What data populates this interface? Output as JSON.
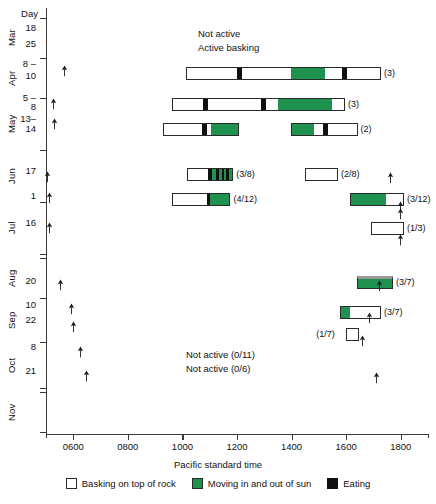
{
  "chart_data": {
    "type": "bar",
    "title": "",
    "xlabel": "Pacific standard time",
    "ylabel": "Day",
    "xlim": [
      500,
      1900
    ],
    "xticks": [
      600,
      800,
      1000,
      1200,
      1400,
      1600,
      1800
    ],
    "xtick_labels": [
      "0600",
      "0800",
      "1000",
      "1200",
      "1400",
      "1600",
      "1800"
    ],
    "grid": false,
    "legend_position": "bottom",
    "legend": [
      {
        "key": "white",
        "label": "Basking on top of rock",
        "color": "#ffffff"
      },
      {
        "key": "green",
        "label": "Moving in and out of sun",
        "color": "#1f9250"
      },
      {
        "key": "black",
        "label": "Eating",
        "color": "#101010"
      }
    ],
    "annotations": [
      {
        "text": "Not active",
        "x": 1050,
        "y_row": "apr-10",
        "offset": -32
      },
      {
        "text": "Active basking",
        "x": 1050,
        "y_row": "apr-10",
        "offset": -20
      },
      {
        "text": "Not active (0/11)",
        "x": 900,
        "y_row": "oct-8"
      },
      {
        "text": "Not active (0/6)",
        "x": 900,
        "y_row": "oct-21"
      }
    ],
    "months": [
      {
        "label": "Mar",
        "top": 18,
        "height": 40
      },
      {
        "label": "Apr",
        "top": 58,
        "height": 40
      },
      {
        "label": "May",
        "top": 98,
        "height": 52
      },
      {
        "label": "Jun",
        "top": 150,
        "height": 52
      },
      {
        "label": "Jul",
        "top": 202,
        "height": 52
      },
      {
        "label": "Aug",
        "top": 258,
        "height": 40
      },
      {
        "label": "Sep",
        "top": 298,
        "height": 44
      },
      {
        "label": "Oct",
        "top": 342,
        "height": 46
      },
      {
        "label": "Nov",
        "top": 392,
        "height": 40
      }
    ],
    "day_labels": [
      {
        "text": "18",
        "y": 28
      },
      {
        "text": "25",
        "y": 44
      },
      {
        "text": "8 –",
        "y": 64
      },
      {
        "text": "10",
        "y": 76
      },
      {
        "text": "5 –",
        "y": 98
      },
      {
        "text": "8",
        "y": 107
      },
      {
        "text": "13–",
        "y": 119
      },
      {
        "text": "14",
        "y": 129
      },
      {
        "text": "17",
        "y": 171
      },
      {
        "text": "1",
        "y": 196
      },
      {
        "text": "16",
        "y": 223
      },
      {
        "text": "20",
        "y": 281
      },
      {
        "text": "10",
        "y": 305
      },
      {
        "text": "22",
        "y": 320
      },
      {
        "text": "8",
        "y": 347
      },
      {
        "text": "21",
        "y": 371
      }
    ],
    "rows": [
      {
        "id": "apr-10",
        "count": "(3)",
        "y": 67,
        "start": 1012,
        "end": 1728,
        "segments": [
          {
            "kind": "white",
            "from": 1012,
            "to": 1198
          },
          {
            "kind": "black",
            "from": 1198,
            "to": 1216
          },
          {
            "kind": "white",
            "from": 1216,
            "to": 1398
          },
          {
            "kind": "green",
            "from": 1398,
            "to": 1524
          },
          {
            "kind": "white",
            "from": 1524,
            "to": 1586
          },
          {
            "kind": "black",
            "from": 1586,
            "to": 1604
          },
          {
            "kind": "white",
            "from": 1604,
            "to": 1728
          }
        ]
      },
      {
        "id": "may-5-8",
        "count": "(3)",
        "y": 98,
        "start": 962,
        "end": 1596,
        "segments": [
          {
            "kind": "white",
            "from": 962,
            "to": 1072
          },
          {
            "kind": "black",
            "from": 1072,
            "to": 1090
          },
          {
            "kind": "white",
            "from": 1090,
            "to": 1290
          },
          {
            "kind": "black",
            "from": 1290,
            "to": 1306
          },
          {
            "kind": "white",
            "from": 1306,
            "to": 1352
          },
          {
            "kind": "green",
            "from": 1352,
            "to": 1552
          },
          {
            "kind": "white",
            "from": 1552,
            "to": 1596
          }
        ]
      },
      {
        "id": "may-13-14-a",
        "count": "",
        "y": 123,
        "start": 928,
        "end": 1208,
        "segments": [
          {
            "kind": "white",
            "from": 928,
            "to": 1072
          },
          {
            "kind": "black",
            "from": 1072,
            "to": 1090
          },
          {
            "kind": "white",
            "from": 1090,
            "to": 1106
          },
          {
            "kind": "green",
            "from": 1106,
            "to": 1208
          }
        ]
      },
      {
        "id": "may-13-14-b",
        "count": "(2)",
        "y": 123,
        "start": 1398,
        "end": 1642,
        "segments": [
          {
            "kind": "green",
            "from": 1398,
            "to": 1480
          },
          {
            "kind": "white",
            "from": 1480,
            "to": 1516
          },
          {
            "kind": "black",
            "from": 1516,
            "to": 1534
          },
          {
            "kind": "white",
            "from": 1534,
            "to": 1642
          }
        ]
      },
      {
        "id": "jun-17-a",
        "count": "(3/8)",
        "y": 168,
        "start": 1018,
        "end": 1186,
        "segments": [
          {
            "kind": "white",
            "from": 1018,
            "to": 1094
          },
          {
            "kind": "black",
            "from": 1094,
            "to": 1110
          },
          {
            "kind": "green",
            "from": 1110,
            "to": 1124
          },
          {
            "kind": "black",
            "from": 1124,
            "to": 1136
          },
          {
            "kind": "green",
            "from": 1136,
            "to": 1146
          },
          {
            "kind": "black",
            "from": 1146,
            "to": 1156
          },
          {
            "kind": "green",
            "from": 1156,
            "to": 1164
          },
          {
            "kind": "black",
            "from": 1164,
            "to": 1174
          },
          {
            "kind": "green",
            "from": 1174,
            "to": 1186
          }
        ]
      },
      {
        "id": "jun-17-b",
        "count": "(2/8)",
        "y": 168,
        "start": 1450,
        "end": 1570,
        "segments": [
          {
            "kind": "white",
            "from": 1450,
            "to": 1570
          }
        ]
      },
      {
        "id": "jul-1-a",
        "count": "(4/12)",
        "y": 193,
        "start": 962,
        "end": 1176,
        "segments": [
          {
            "kind": "white",
            "from": 962,
            "to": 1090
          },
          {
            "kind": "black",
            "from": 1090,
            "to": 1104
          },
          {
            "kind": "green",
            "from": 1104,
            "to": 1176
          }
        ]
      },
      {
        "id": "jul-1-b",
        "count": "(3/12)",
        "y": 193,
        "start": 1614,
        "end": 1812,
        "segments": [
          {
            "kind": "green",
            "from": 1614,
            "to": 1748
          },
          {
            "kind": "white",
            "from": 1748,
            "to": 1812
          }
        ]
      },
      {
        "id": "jul-16",
        "count": "(1/3)",
        "y": 222,
        "start": 1692,
        "end": 1812,
        "segments": [
          {
            "kind": "white",
            "from": 1692,
            "to": 1812
          }
        ]
      },
      {
        "id": "aug-20",
        "count": "(3/7)",
        "y": 276,
        "start": 1640,
        "end": 1772,
        "top_edge": true,
        "segments": [
          {
            "kind": "green",
            "from": 1640,
            "to": 1772
          }
        ]
      },
      {
        "id": "sep-10",
        "count": "(3/7)",
        "y": 306,
        "start": 1576,
        "end": 1728,
        "segments": [
          {
            "kind": "green",
            "from": 1576,
            "to": 1614
          },
          {
            "kind": "white",
            "from": 1614,
            "to": 1728
          }
        ]
      },
      {
        "id": "sep-22",
        "count": "(1/7)",
        "y": 328,
        "count_side": "left",
        "start": 1600,
        "end": 1646,
        "segments": [
          {
            "kind": "white",
            "from": 1600,
            "to": 1646
          }
        ]
      }
    ],
    "sun_markers": [
      {
        "x": 568,
        "y": 71,
        "dir": "up"
      },
      {
        "x": 528,
        "y": 104,
        "dir": "up"
      },
      {
        "x": 530,
        "y": 124,
        "dir": "up"
      },
      {
        "x": 505,
        "y": 177,
        "dir": "up"
      },
      {
        "x": 512,
        "y": 198,
        "dir": "up"
      },
      {
        "x": 513,
        "y": 228,
        "dir": "up"
      },
      {
        "x": 1762,
        "y": 178,
        "dir": "up"
      },
      {
        "x": 1800,
        "y": 207,
        "dir": "up"
      },
      {
        "x": 1800,
        "y": 214,
        "dir": "up"
      },
      {
        "x": 1800,
        "y": 240,
        "dir": "up"
      },
      {
        "x": 552,
        "y": 285,
        "dir": "up"
      },
      {
        "x": 592,
        "y": 309,
        "dir": "up"
      },
      {
        "x": 600,
        "y": 327,
        "dir": "up"
      },
      {
        "x": 628,
        "y": 352,
        "dir": "up"
      },
      {
        "x": 648,
        "y": 376,
        "dir": "up"
      },
      {
        "x": 1722,
        "y": 286,
        "dir": "up"
      },
      {
        "x": 1684,
        "y": 318,
        "dir": "up"
      },
      {
        "x": 1660,
        "y": 341,
        "dir": "up"
      },
      {
        "x": 1712,
        "y": 378,
        "dir": "up"
      }
    ]
  },
  "labels": {
    "day_header": "Day",
    "not_active": "Not active",
    "active_basking": "Active basking",
    "not_active_0_11": "Not active (0/11)",
    "not_active_0_6": "Not active (0/6)",
    "x_axis_title": "Pacific standard time"
  }
}
